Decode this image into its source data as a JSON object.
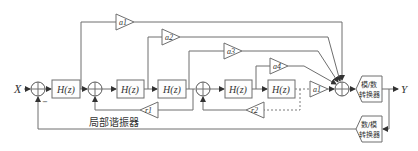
{
  "diagram": {
    "type": "block-diagram",
    "input_label": "X",
    "output_label": "Y",
    "blocks": {
      "h1": "H(z)",
      "h2": "H(z)",
      "h3": "H(z)",
      "h4": "H(z)",
      "h5": "H(z)"
    },
    "feedforward_gains": {
      "a1_top": "a1",
      "a2": "a2",
      "a3": "a3",
      "a4": "a4",
      "a1_final": "a1"
    },
    "feedback_gains": {
      "r1": "r1",
      "r2": "r2"
    },
    "minus_sign": "−",
    "resonator_label": "局部谐振器",
    "adc": {
      "line1": "模/数",
      "line2": "转换器"
    },
    "dac": {
      "line1": "数/模",
      "line2": "转换器"
    }
  }
}
